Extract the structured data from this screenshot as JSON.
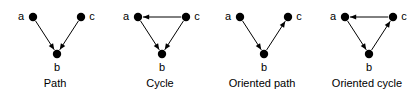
{
  "figure": {
    "background_color": "#ffffff",
    "stroke_color": "#000000",
    "node_fill_color": "#000000",
    "node_radius": 4.2,
    "width": 419,
    "height": 98
  },
  "panels": [
    {
      "id": "path",
      "caption": "Path",
      "nodes": [
        {
          "id": "a",
          "label": "a",
          "x": 33,
          "y": 17,
          "label_x": 21,
          "label_y": 20
        },
        {
          "id": "b",
          "label": "b",
          "x": 57,
          "y": 54,
          "label_x": 57,
          "label_y": 71
        },
        {
          "id": "c",
          "label": "c",
          "x": 81,
          "y": 17,
          "label_x": 92,
          "label_y": 20
        }
      ],
      "edges": [
        {
          "from": "a",
          "to": "b",
          "arrow": true
        },
        {
          "from": "c",
          "to": "b",
          "arrow": true
        }
      ]
    },
    {
      "id": "cycle",
      "caption": "Cycle",
      "nodes": [
        {
          "id": "a",
          "label": "a",
          "x": 33,
          "y": 17,
          "label_x": 21,
          "label_y": 20
        },
        {
          "id": "b",
          "label": "b",
          "x": 57,
          "y": 54,
          "label_x": 57,
          "label_y": 71
        },
        {
          "id": "c",
          "label": "c",
          "x": 81,
          "y": 17,
          "label_x": 92,
          "label_y": 20
        }
      ],
      "edges": [
        {
          "from": "a",
          "to": "b",
          "arrow": true
        },
        {
          "from": "c",
          "to": "b",
          "arrow": true
        },
        {
          "from": "c",
          "to": "a",
          "arrow": true
        }
      ]
    },
    {
      "id": "oriented-path",
      "caption": "Oriented path",
      "nodes": [
        {
          "id": "a",
          "label": "a",
          "x": 33,
          "y": 17,
          "label_x": 21,
          "label_y": 20
        },
        {
          "id": "b",
          "label": "b",
          "x": 57,
          "y": 54,
          "label_x": 57,
          "label_y": 71
        },
        {
          "id": "c",
          "label": "c",
          "x": 81,
          "y": 17,
          "label_x": 92,
          "label_y": 20
        }
      ],
      "edges": [
        {
          "from": "a",
          "to": "b",
          "arrow": true
        },
        {
          "from": "b",
          "to": "c",
          "arrow": true
        }
      ]
    },
    {
      "id": "oriented-cycle",
      "caption": "Oriented cycle",
      "nodes": [
        {
          "id": "a",
          "label": "a",
          "x": 33,
          "y": 17,
          "label_x": 21,
          "label_y": 20
        },
        {
          "id": "b",
          "label": "b",
          "x": 57,
          "y": 54,
          "label_x": 57,
          "label_y": 71
        },
        {
          "id": "c",
          "label": "c",
          "x": 81,
          "y": 17,
          "label_x": 92,
          "label_y": 20
        }
      ],
      "edges": [
        {
          "from": "a",
          "to": "b",
          "arrow": true
        },
        {
          "from": "b",
          "to": "c",
          "arrow": true
        },
        {
          "from": "c",
          "to": "a",
          "arrow": true
        }
      ]
    }
  ],
  "panel_layout": {
    "lefts": [
      0,
      105,
      207,
      312
    ],
    "width": 110
  }
}
